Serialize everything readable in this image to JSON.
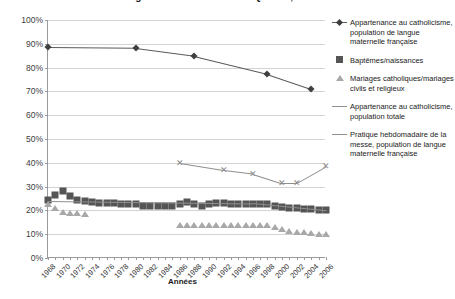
{
  "chart_data": {
    "type": "line",
    "title": "Figure 1 : Catholicisme au Québec, 1968-2006",
    "xlabel": "Années",
    "ylabel": "",
    "xlim": [
      1968,
      2006
    ],
    "ylim": [
      0,
      100
    ],
    "ytick_labels": [
      "0%",
      "10%",
      "20%",
      "30%",
      "40%",
      "50%",
      "60%",
      "70%",
      "80%",
      "90%",
      "100%"
    ],
    "ytick_values": [
      0,
      10,
      20,
      30,
      40,
      50,
      60,
      70,
      80,
      90,
      100
    ],
    "xtick_labels": [
      "1968",
      "1970",
      "1972",
      "1974",
      "1976",
      "1978",
      "1980",
      "1982",
      "1984",
      "1986",
      "1988",
      "1990",
      "1992",
      "1994",
      "1996",
      "1998",
      "2000",
      "2002",
      "2004",
      "2006"
    ],
    "xtick_values": [
      1968,
      1970,
      1972,
      1974,
      1976,
      1978,
      1980,
      1982,
      1984,
      1986,
      1988,
      1990,
      1992,
      1994,
      1996,
      1998,
      2000,
      2002,
      2004,
      2006
    ],
    "grid": true,
    "legend_position": "right",
    "series": [
      {
        "name": "Appartenance au catholicisme, population de langue maternelle française",
        "marker": "diamond",
        "color": "#3f3f3f",
        "x": [
          1968,
          1980,
          1988,
          1998,
          2004
        ],
        "values": [
          88.6,
          88.3,
          85.0,
          77.5,
          71.2
        ]
      },
      {
        "name": "Baptêmes/naissances",
        "marker": "square",
        "color": "#555555",
        "x": [
          1968,
          1969,
          1970,
          1971,
          1972,
          1973,
          1974,
          1975,
          1976,
          1977,
          1978,
          1979,
          1980,
          1981,
          1982,
          1983,
          1984,
          1985,
          1986,
          1987,
          1988,
          1989,
          1990,
          1991,
          1992,
          1993,
          1994,
          1995,
          1996,
          1997,
          1998,
          1999,
          2000,
          2001,
          2002,
          2003,
          2004,
          2005,
          2006
        ],
        "values": [
          24.5,
          26.5,
          28.0,
          26.0,
          24.5,
          24.0,
          23.5,
          23.0,
          23.0,
          23.0,
          22.5,
          22.5,
          22.5,
          22.0,
          22.0,
          22.0,
          22.0,
          22.0,
          22.5,
          23.5,
          22.5,
          22.0,
          22.5,
          23.0,
          23.0,
          22.5,
          22.5,
          22.5,
          22.5,
          22.5,
          22.5,
          22.0,
          21.5,
          21.0,
          21.0,
          20.5,
          20.5,
          20.0,
          20.0
        ]
      },
      {
        "name": "Mariages catholiques/mariages civils et religieux",
        "marker": "triangle",
        "color": "#a8a8a8",
        "x": [
          1968,
          1969,
          1970,
          1971,
          1972,
          1973,
          1986,
          1987,
          1988,
          1989,
          1990,
          1991,
          1992,
          1993,
          1994,
          1995,
          1996,
          1997,
          1998,
          1999,
          2000,
          2001,
          2002,
          2003,
          2004,
          2005,
          2006
        ],
        "values": [
          22.5,
          21.0,
          19.5,
          19.0,
          19.0,
          18.5,
          14.0,
          14.0,
          14.0,
          14.0,
          14.0,
          14.0,
          14.0,
          14.0,
          14.0,
          14.0,
          14.0,
          14.0,
          14.0,
          13.0,
          12.0,
          11.5,
          11.0,
          11.0,
          10.5,
          10.0,
          10.0
        ]
      },
      {
        "name": "Appartenance au catholicisme, population totale",
        "marker": "x",
        "color": "#8f8f8f",
        "x": [
          1986,
          1992,
          1996,
          2000,
          2002,
          2006
        ],
        "values": [
          40.0,
          37.0,
          35.5,
          31.5,
          31.5,
          38.5
        ]
      },
      {
        "name": "Pratique hebdomadaire de la messe, population de langue maternelle française",
        "marker": "line",
        "color": "#8f8f8f",
        "x": [
          1968,
          1996,
          2006
        ],
        "values": [
          24.0,
          23.0,
          20.0
        ]
      }
    ]
  },
  "legend": {
    "items": [
      {
        "label": "Appartenance au catholicisme, population de langue maternelle française",
        "key": "diamond-line"
      },
      {
        "label": "Baptêmes/naissances",
        "key": "square"
      },
      {
        "label": "Mariages catholiques/mariages civils et religieux",
        "key": "triangle"
      },
      {
        "label": "Appartenance au catholicisme, population totale",
        "key": "line"
      },
      {
        "label": "Pratique hebdomadaire de la messe, population de langue maternelle française",
        "key": "line"
      }
    ]
  }
}
